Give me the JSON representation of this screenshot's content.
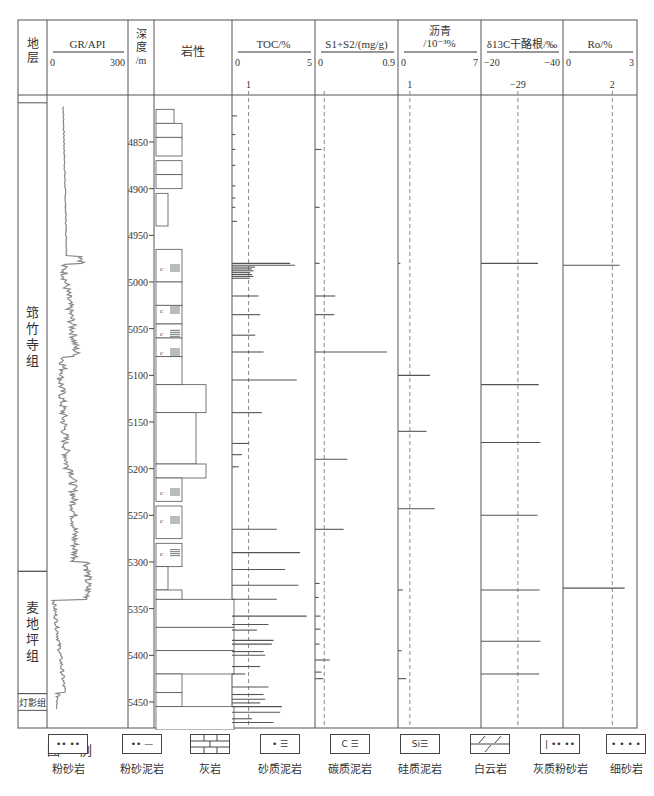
{
  "chart_data": {
    "type": "well-log",
    "title": "",
    "depth_axis": {
      "label": "深度/m",
      "ticks": [
        4850,
        4900,
        4950,
        5000,
        5050,
        5100,
        5150,
        5200,
        5250,
        5300,
        5350,
        5400,
        5450
      ],
      "range": [
        4810,
        5475
      ]
    },
    "columns": [
      {
        "id": "strata",
        "header": "地层"
      },
      {
        "id": "gr",
        "header": "GR/API",
        "min": 0,
        "max": 300
      },
      {
        "id": "depth",
        "header": "深度\n/m"
      },
      {
        "id": "lith",
        "header": "岩性"
      },
      {
        "id": "toc",
        "header": "TOC/%",
        "min": 0,
        "max": 5,
        "ref": 1,
        "ref_label": "1"
      },
      {
        "id": "s1s2",
        "header": "S1+S2/(mg/g)",
        "min": 0,
        "max": 0.9,
        "ref": 0.1,
        "ref_label": ""
      },
      {
        "id": "bitumen",
        "header": "沥青\n/10⁻³%",
        "min": 0,
        "max": 7,
        "ref": 1,
        "ref_label": "1"
      },
      {
        "id": "d13c",
        "header": "δ13C干酪根/‰",
        "min": -20,
        "max": -40,
        "ref": -29,
        "ref_label": "−29"
      },
      {
        "id": "ro",
        "header": "Ro/%",
        "min": 0,
        "max": 3,
        "ref": 2,
        "ref_label": "2"
      }
    ],
    "formations": [
      {
        "name": "筇竹寺组",
        "top": 4808,
        "bottom": 5310
      },
      {
        "name": "麦地坪组",
        "top": 5310,
        "bottom": 5441
      },
      {
        "name": "灯影组",
        "top": 5441,
        "bottom": 5459
      }
    ],
    "series": [
      {
        "name": "TOC/%",
        "points": [
          [
            4822,
            0.3
          ],
          [
            4842,
            0.2
          ],
          [
            4858,
            0.2
          ],
          [
            4875,
            0.2
          ],
          [
            4897,
            0.2
          ],
          [
            4910,
            0.2
          ],
          [
            4920,
            0.2
          ],
          [
            4935,
            0.3
          ],
          [
            4980,
            3.5
          ],
          [
            4982,
            3.8
          ],
          [
            4984,
            1.4
          ],
          [
            4986,
            1.2
          ],
          [
            4988,
            1.3
          ],
          [
            4990,
            1.1
          ],
          [
            4992,
            1.2
          ],
          [
            4994,
            1.3
          ],
          [
            4996,
            1.1
          ],
          [
            5015,
            1.6
          ],
          [
            5035,
            1.7
          ],
          [
            5057,
            1.4
          ],
          [
            5075,
            1.9
          ],
          [
            5105,
            3.9
          ],
          [
            5140,
            1.8
          ],
          [
            5173,
            1.0
          ],
          [
            5185,
            0.6
          ],
          [
            5198,
            0.4
          ],
          [
            5265,
            2.7
          ],
          [
            5290,
            4.1
          ],
          [
            5308,
            3.2
          ],
          [
            5325,
            4.0
          ],
          [
            5340,
            2.7
          ],
          [
            5358,
            4.5
          ],
          [
            5367,
            2.2
          ],
          [
            5373,
            1.5
          ],
          [
            5384,
            2.5
          ],
          [
            5388,
            2.4
          ],
          [
            5396,
            1.9
          ],
          [
            5400,
            2.0
          ],
          [
            5412,
            1.7
          ],
          [
            5420,
            0.8
          ],
          [
            5434,
            2.2
          ],
          [
            5442,
            1.9
          ],
          [
            5447,
            2.0
          ],
          [
            5451,
            1.7
          ],
          [
            5455,
            3.0
          ],
          [
            5461,
            2.9
          ],
          [
            5468,
            1.2
          ],
          [
            5472,
            2.5
          ],
          [
            5479,
            3.1
          ],
          [
            5484,
            2.4
          ],
          [
            5490,
            2.7
          ]
        ]
      },
      {
        "name": "S1+S2/(mg/g)",
        "points": [
          [
            4858,
            0.07
          ],
          [
            4920,
            0.05
          ],
          [
            4980,
            0.05
          ],
          [
            5015,
            0.22
          ],
          [
            5035,
            0.21
          ],
          [
            5075,
            0.78
          ],
          [
            5190,
            0.35
          ],
          [
            5265,
            0.31
          ],
          [
            5323,
            0.05
          ],
          [
            5338,
            0.04
          ],
          [
            5358,
            0.06
          ],
          [
            5372,
            0.06
          ],
          [
            5388,
            0.05
          ],
          [
            5405,
            0.16
          ],
          [
            5418,
            0.07
          ],
          [
            5425,
            0.09
          ]
        ]
      },
      {
        "name": "沥青/10⁻³%",
        "points": [
          [
            4980,
            0.2
          ],
          [
            5100,
            2.7
          ],
          [
            5160,
            2.4
          ],
          [
            5243,
            3.1
          ],
          [
            5330,
            0.4
          ],
          [
            5395,
            0.3
          ],
          [
            5425,
            0.7
          ]
        ]
      },
      {
        "name": "δ13C干酪根/‰",
        "points": [
          [
            4980,
            -33.9
          ],
          [
            5110,
            -34.1
          ],
          [
            5172,
            -34.5
          ],
          [
            5250,
            -33.8
          ],
          [
            5330,
            -34.3
          ],
          [
            5385,
            -34.5
          ],
          [
            5420,
            -34.2
          ]
        ]
      },
      {
        "name": "Ro/%",
        "points": [
          [
            4982,
            2.3
          ],
          [
            5328,
            2.5
          ]
        ]
      }
    ]
  },
  "legend": {
    "title": "图 例",
    "items": [
      {
        "label": "粉砂岩",
        "sym": "•• ••"
      },
      {
        "label": "粉砂泥岩",
        "sym": "•• —"
      },
      {
        "label": "灰岩",
        "sym": "brick"
      },
      {
        "label": "砂质泥岩",
        "sym": "• ☰"
      },
      {
        "label": "碳质泥岩",
        "sym": "C ☰"
      },
      {
        "label": "硅质泥岩",
        "sym": "Si☰"
      },
      {
        "label": "白云岩",
        "sym": "dolomite"
      },
      {
        "label": "灰质粉砂岩",
        "sym": "| •• ••"
      },
      {
        "label": "细砂岩",
        "sym": "• • • •"
      }
    ]
  }
}
